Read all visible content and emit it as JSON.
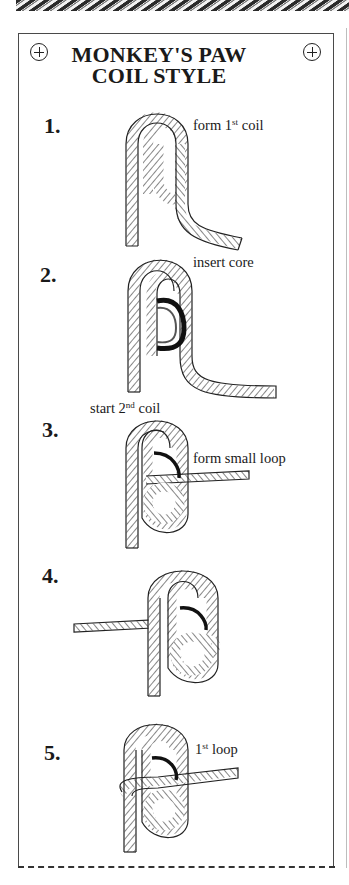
{
  "document": {
    "title_line1": "MONKEY'S PAW",
    "title_line2": "COIL STYLE",
    "corner_icons": [
      "plus-circle-icon",
      "plus-circle-icon"
    ]
  },
  "steps": [
    {
      "number": "1.",
      "caption_pre": "form 1",
      "caption_sup": "st",
      "caption_post": " coil"
    },
    {
      "number": "2.",
      "caption": "insert core"
    },
    {
      "number": "3.",
      "caption_top_pre": "start 2",
      "caption_top_sup": "nd",
      "caption_top_post": " coil",
      "caption": "form small loop"
    },
    {
      "number": "4."
    },
    {
      "number": "5.",
      "caption_pre": "1",
      "caption_sup": "st",
      "caption_post": " loop"
    }
  ],
  "colors": {
    "ink": "#1a1a1a",
    "border": "#4a4a4a",
    "background": "#ffffff"
  }
}
